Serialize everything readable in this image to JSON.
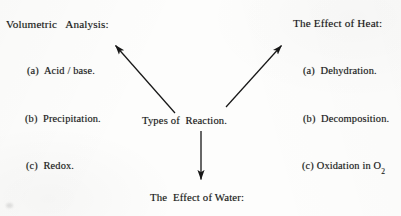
{
  "document": {
    "type": "hand-drawn chemistry concept diagram (scanned)",
    "background_color": "#fdfdfc",
    "ink_color": "#191919"
  },
  "center": {
    "label": "Types of  Reaction."
  },
  "branches": {
    "top_left": {
      "heading": "Volumetric   Analysis:",
      "items": [
        "(a)  Acid / base.",
        "(b)  Precipitation.",
        "(c)  Redox."
      ]
    },
    "top_right": {
      "heading": "The Effect of Heat:",
      "items": [
        "(a)  Dehydration.",
        "(b)  Decomposition.",
        "(c) Oxidation in O"
      ],
      "item_c_subscript": "2"
    },
    "bottom": {
      "heading": "The  Effect of Water:"
    }
  },
  "arrows": [
    {
      "name": "arrow-to-volumetric-analysis",
      "from": [
        175,
        113
      ],
      "to": [
        113,
        43
      ],
      "direction": "up-left"
    },
    {
      "name": "arrow-to-effect-of-heat",
      "from": [
        226,
        107
      ],
      "to": [
        284,
        43
      ],
      "direction": "up-right"
    },
    {
      "name": "arrow-to-effect-of-water",
      "from": [
        201,
        131
      ],
      "to": [
        201,
        183
      ],
      "direction": "down"
    }
  ]
}
